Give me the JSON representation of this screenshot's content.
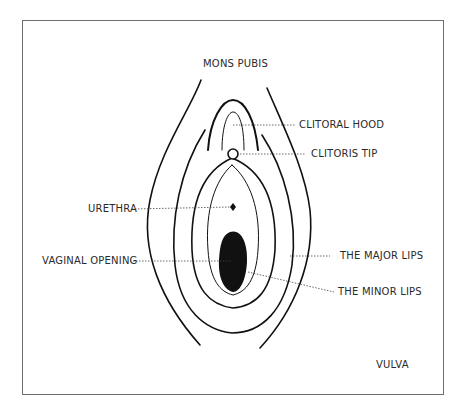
{
  "diagram": {
    "title": "VULVA",
    "labels": {
      "mons_pubis": "MONS PUBIS",
      "clitoral_hood": "CLITORAL HOOD",
      "clitoris_tip": "CLITORIS TIP",
      "urethra": "URETHRA",
      "vaginal_opening": "VAGINAL OPENING",
      "major_lips": "THE MAJOR LIPS",
      "minor_lips": "THE MINOR LIPS"
    },
    "colors": {
      "line": "#111111",
      "frame": "#6e6e6e",
      "text": "#2a2a2a",
      "background": "#ffffff"
    }
  }
}
